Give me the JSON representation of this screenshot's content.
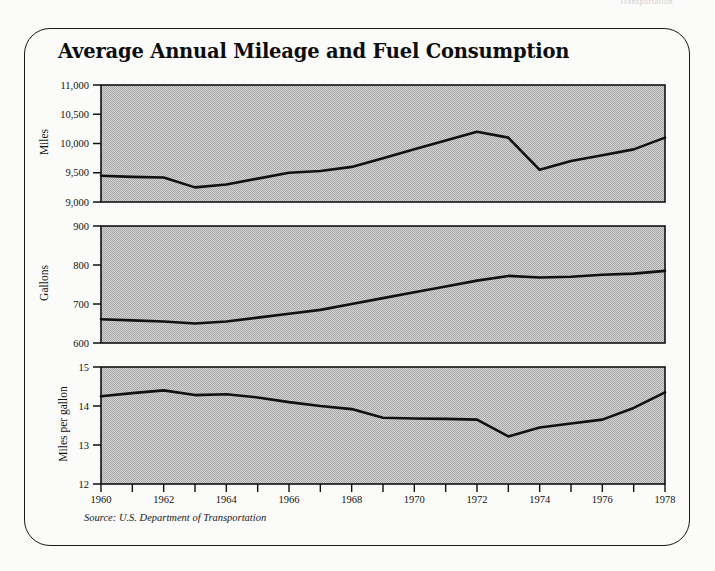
{
  "page": {
    "cut_header_text": "Transportation",
    "title": "Average Annual Mileage and Fuel Consumption",
    "source_note": "Source: U.S. Department of Transportation",
    "frame_color": "#1a1a1a",
    "plot_fill": "#c9c9c9",
    "line_color": "#111111"
  },
  "chart_data": [
    {
      "type": "line",
      "title": "Average Annual Mileage and Fuel Consumption",
      "panel": "miles",
      "xlabel": "",
      "ylabel": "Miles",
      "ylim": [
        9000,
        11000
      ],
      "yticks": [
        9000,
        9500,
        10000,
        10500,
        11000
      ],
      "ytick_labels": [
        "9,000",
        "9,500",
        "10,000",
        "10,500",
        "11,000"
      ],
      "xlim": [
        1960,
        1978
      ],
      "grid": false,
      "legend": "none",
      "x": [
        1960,
        1961,
        1962,
        1963,
        1964,
        1965,
        1966,
        1967,
        1968,
        1969,
        1970,
        1971,
        1972,
        1973,
        1974,
        1975,
        1976,
        1977,
        1978
      ],
      "values": [
        9450,
        9430,
        9420,
        9250,
        9300,
        9400,
        9500,
        9530,
        9600,
        9750,
        9900,
        10050,
        10200,
        10100,
        9550,
        9700,
        9800,
        9900,
        10100
      ]
    },
    {
      "type": "line",
      "panel": "gallons",
      "xlabel": "",
      "ylabel": "Gallons",
      "ylim": [
        600,
        900
      ],
      "yticks": [
        600,
        700,
        800,
        900
      ],
      "ytick_labels": [
        "600",
        "700",
        "800",
        "900"
      ],
      "xlim": [
        1960,
        1978
      ],
      "grid": false,
      "legend": "none",
      "x": [
        1960,
        1961,
        1962,
        1963,
        1964,
        1965,
        1966,
        1967,
        1968,
        1969,
        1970,
        1971,
        1972,
        1973,
        1974,
        1975,
        1976,
        1977,
        1978
      ],
      "values": [
        661,
        658,
        655,
        650,
        655,
        665,
        675,
        685,
        700,
        715,
        730,
        745,
        760,
        772,
        768,
        770,
        775,
        778,
        785
      ]
    },
    {
      "type": "line",
      "panel": "miles_per_gallon",
      "xlabel": "",
      "ylabel": "Miles per gallon",
      "ylim": [
        12,
        15
      ],
      "yticks": [
        12,
        13,
        14,
        15
      ],
      "ytick_labels": [
        "12",
        "13",
        "14",
        "15"
      ],
      "xlim": [
        1960,
        1978
      ],
      "grid": false,
      "legend": "none",
      "x": [
        1960,
        1961,
        1962,
        1963,
        1964,
        1965,
        1966,
        1967,
        1968,
        1969,
        1970,
        1971,
        1972,
        1973,
        1974,
        1975,
        1976,
        1977,
        1978
      ],
      "values": [
        14.25,
        14.33,
        14.4,
        14.28,
        14.3,
        14.22,
        14.1,
        14.0,
        13.92,
        13.7,
        13.68,
        13.67,
        13.65,
        13.22,
        13.45,
        13.55,
        13.65,
        13.95,
        14.35
      ]
    }
  ],
  "xaxis": {
    "tick_years": [
      1960,
      1961,
      1962,
      1963,
      1964,
      1965,
      1966,
      1967,
      1968,
      1969,
      1970,
      1971,
      1972,
      1973,
      1974,
      1975,
      1976,
      1977,
      1978
    ],
    "labeled_years": [
      "1960",
      "1962",
      "1964",
      "1966",
      "1968",
      "1970",
      "1972",
      "1974",
      "1976",
      "1978"
    ]
  }
}
